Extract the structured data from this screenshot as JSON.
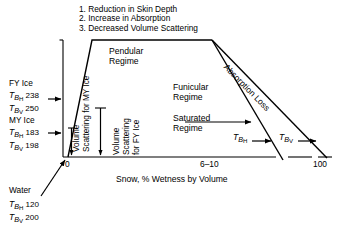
{
  "figure": {
    "type": "schematic-diagram",
    "notes": [
      "1. Reduction in Skin Depth",
      "2. Increase in Absorption",
      "3. Decreased Volume Scattering"
    ],
    "axis": {
      "x_title": "Snow, % Wetness by Volume",
      "x_ticks": [
        "0",
        "6–10",
        "100"
      ]
    },
    "regimes": {
      "pendular": [
        "Pendular",
        "Regime"
      ],
      "funicular": [
        "Funicular",
        "Regime"
      ],
      "saturated": [
        "Saturated",
        "Regime"
      ]
    },
    "absorption_label": "Absorption Loss",
    "scattering": {
      "my_ice": [
        "Volume",
        "Scattering for MY Ice"
      ],
      "fy_ice": [
        "Volume",
        "Scattering",
        "for FY Ice"
      ]
    },
    "curve_labels": {
      "h": {
        "sym": "T",
        "sub": "B",
        "sub2": "H"
      },
      "v": {
        "sym": "T",
        "sub": "B",
        "sub2": "V"
      }
    },
    "left_blocks": [
      {
        "name": "FY Ice",
        "rows": [
          {
            "sym": "T",
            "sub": "B",
            "sub2": "H",
            "value": "238"
          },
          {
            "sym": "T",
            "sub": "B",
            "sub2": "V",
            "value": "250"
          }
        ]
      },
      {
        "name": "MY Ice",
        "rows": [
          {
            "sym": "T",
            "sub": "B",
            "sub2": "H",
            "value": "183"
          },
          {
            "sym": "T",
            "sub": "B",
            "sub2": "V",
            "value": "198"
          }
        ]
      },
      {
        "name": "Water",
        "rows": [
          {
            "sym": "T",
            "sub": "B",
            "sub2": "H",
            "value": "120"
          },
          {
            "sym": "T",
            "sub": "B",
            "sub2": "V",
            "value": "200"
          }
        ]
      }
    ],
    "colors": {
      "ink": "#000000",
      "paper": "#ffffff"
    }
  }
}
